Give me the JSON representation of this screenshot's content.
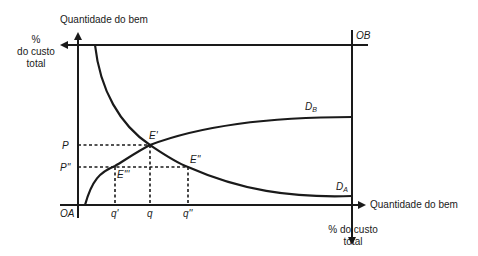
{
  "diagram": {
    "type": "edgeworth-box-cost-sharing",
    "axes": {
      "left_vertical_label": "Quantidade do bem",
      "top_left_label": [
        "%",
        "do custo",
        "total"
      ],
      "bottom_right_label": "Quantidade do bem",
      "bottom_label": [
        "% do custo",
        "total"
      ]
    },
    "origins": {
      "a": "OA",
      "b": "OB"
    },
    "curves": {
      "db": {
        "label": "D",
        "sub": "B"
      },
      "da": {
        "label": "D",
        "sub": "A"
      }
    },
    "points": {
      "e1": "E'",
      "e2": "E''",
      "e3": "E'''"
    },
    "y_levels": {
      "p": "P",
      "p2": "P''"
    },
    "x_levels": {
      "q1": "q'",
      "q": "q",
      "q2": "q''"
    },
    "colors": {
      "line": "#1a1a1a",
      "background": "#ffffff"
    }
  }
}
